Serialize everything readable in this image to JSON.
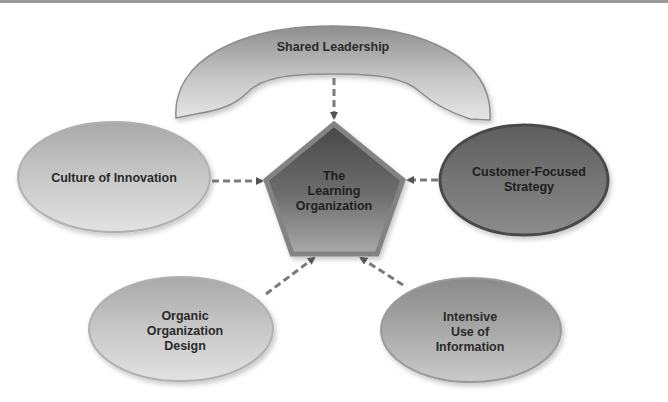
{
  "diagram": {
    "center": {
      "lines": [
        "The",
        "Learning",
        "Organization"
      ],
      "shape": "pentagon"
    },
    "nodes": [
      {
        "id": "shared-leadership",
        "lines": [
          "Shared Leadership"
        ],
        "shape": "arch",
        "fill": "#bdbdbd"
      },
      {
        "id": "culture-of-innovation",
        "lines": [
          "Culture of Innovation"
        ],
        "shape": "ellipse",
        "fill": "#c4c4c4"
      },
      {
        "id": "customer-focused-strategy",
        "lines": [
          "Customer-Focused",
          "Strategy"
        ],
        "shape": "ellipse",
        "fill": "#707070"
      },
      {
        "id": "organic-organization-design",
        "lines": [
          "Organic",
          "Organization",
          "Design"
        ],
        "shape": "ellipse",
        "fill": "#c4c4c4"
      },
      {
        "id": "intensive-use-of-information",
        "lines": [
          "Intensive",
          "Use of",
          "Information"
        ],
        "shape": "ellipse",
        "fill": "#a8a8a8"
      }
    ],
    "edges": [
      {
        "from": "shared-leadership",
        "to": "center",
        "style": "dashed-arrow"
      },
      {
        "from": "culture-of-innovation",
        "to": "center",
        "style": "dashed-arrow"
      },
      {
        "from": "customer-focused-strategy",
        "to": "center",
        "style": "dashed-arrow"
      },
      {
        "from": "organic-organization-design",
        "to": "center",
        "style": "dashed-arrow"
      },
      {
        "from": "intensive-use-of-information",
        "to": "center",
        "style": "dashed-arrow"
      }
    ],
    "colors": {
      "pentagon_fill": "#5a5a5a",
      "pentagon_border": "#8a8a8a",
      "arrow": "#707070",
      "top_bar": "#9a9a9a"
    }
  }
}
